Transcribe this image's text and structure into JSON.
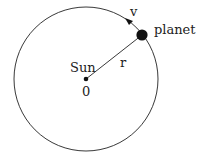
{
  "diagram": {
    "labels": {
      "sun": "Sun",
      "origin": "0",
      "radius": "r",
      "velocity": "v",
      "planet": "planet"
    },
    "colors": {
      "stroke": "#222222",
      "background": "#ffffff"
    },
    "geometry": {
      "orbit_center": [
        86,
        79
      ],
      "orbit_radius": 72,
      "planet_position": [
        142,
        35
      ],
      "planet_radius": 5.5,
      "sun_radius": 2.2,
      "direction": "counterclockwise"
    }
  }
}
